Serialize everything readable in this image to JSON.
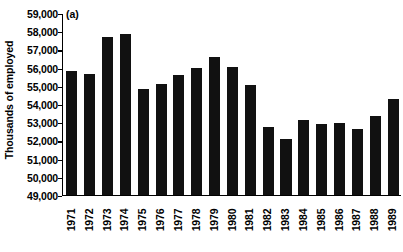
{
  "chart_data": {
    "type": "bar",
    "title": "",
    "panel_label": "(a)",
    "xlabel": "",
    "ylabel": "Thousands of employed",
    "ylim": [
      49000,
      59000
    ],
    "ytick_labels": [
      "59,000",
      "58,000",
      "57,000",
      "56,000",
      "55,000",
      "54,000",
      "53,000",
      "52,000",
      "51,000",
      "50,000",
      "49,000"
    ],
    "ytick_values": [
      59000,
      58000,
      57000,
      56000,
      55000,
      54000,
      53000,
      52000,
      51000,
      50000,
      49000
    ],
    "grid": false,
    "legend": "none",
    "bar_color": "#111111",
    "categories": [
      "1971",
      "1972",
      "1973",
      "1974",
      "1975",
      "1976",
      "1977",
      "1978",
      "1979",
      "1980",
      "1981",
      "1982",
      "1983",
      "1984",
      "1985",
      "1986",
      "1987",
      "1988",
      "1989"
    ],
    "values": [
      55800,
      55650,
      57700,
      57850,
      54850,
      55100,
      55600,
      56000,
      56600,
      56050,
      55050,
      52750,
      52100,
      53100,
      52900,
      52950,
      52600,
      53350,
      54300
    ]
  }
}
